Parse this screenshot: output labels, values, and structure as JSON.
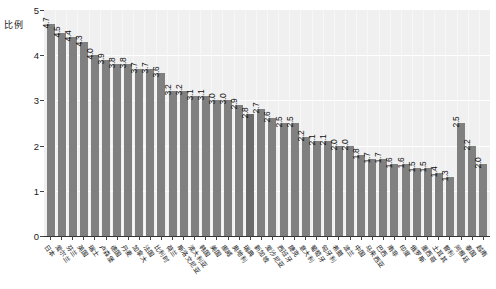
{
  "chart_data": {
    "type": "bar",
    "title": "",
    "xlabel": "",
    "ylabel": "比例",
    "ylim": [
      0,
      5
    ],
    "yticks": [
      "0",
      "1",
      "2",
      "3",
      "4",
      "5"
    ],
    "grid": true,
    "legend": "none",
    "bar_color": "#808080",
    "highlight_color": "#6b6b6b",
    "plot_background": "#f0f0f0",
    "highlight_category": "瑞典",
    "categories": [
      "日本",
      "爱尔兰",
      "芬兰",
      "英国",
      "瑞士",
      "卢森堡",
      "德国",
      "丹麦",
      "加拿大",
      "法国",
      "比利时",
      "荷兰",
      "斯洛文尼亚",
      "澳大利亚",
      "韩国",
      "美国",
      "挪威",
      "奥地利",
      "瑞典",
      "新加坡",
      "爱沙尼亚",
      "西班牙",
      "捷克",
      "意大利",
      "葡萄牙",
      "匈牙利",
      "希腊",
      "波兰",
      "中国",
      "马来西亚",
      "巴西",
      "南非",
      "印度",
      "俄罗斯",
      "墨西哥",
      "土耳其",
      "智利",
      "阿根廷",
      "泰国",
      "越南"
    ],
    "values": [
      4.7,
      4.5,
      4.4,
      4.3,
      4.0,
      3.9,
      3.8,
      3.8,
      3.7,
      3.7,
      3.6,
      3.2,
      3.2,
      3.1,
      3.1,
      3.0,
      3.0,
      2.9,
      2.7,
      2.8,
      2.6,
      2.5,
      2.5,
      2.2,
      2.1,
      2.1,
      2.0,
      2.0,
      1.8,
      1.7,
      1.7,
      1.6,
      1.6,
      1.5,
      1.5,
      1.4,
      1.3,
      2.5,
      2.0,
      1.6
    ],
    "value_labels": [
      "4.7",
      "4.5",
      "4.4",
      "4.3",
      "4.0",
      "3.9",
      "3.8",
      "3.8",
      "3.7",
      "3.7",
      "3.6",
      "3.2",
      "3.2",
      "3.1",
      "3.1",
      "3.0",
      "3.0",
      "2.9",
      "2.8",
      "2.7",
      "2.6",
      "2.5",
      "2.5",
      "2.2",
      "2.1",
      "2.1",
      "2.0",
      "2.0",
      "1.8",
      "1.7",
      "1.7",
      "1.6",
      "1.6",
      "1.5",
      "1.5",
      "1.4",
      "1.3",
      "2.5",
      "2.2",
      "2.0"
    ]
  }
}
